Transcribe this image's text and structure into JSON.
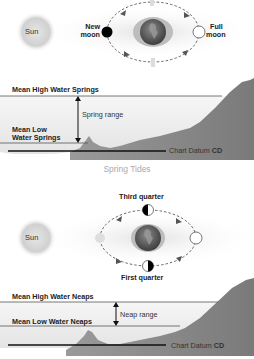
{
  "spring": {
    "sun_label": "Sun",
    "new_moon_label_1": "New",
    "new_moon_label_2": "moon",
    "full_moon_label_1": "Full",
    "full_moon_label_2": "moon",
    "mhws_label": "Mean High Water Springs",
    "mlws_label_1": "Mean Low",
    "mlws_label_2": "Water Springs",
    "range_label": "Spring range",
    "datum_label": "Chart Datum",
    "datum_abbrev": "CD",
    "caption": "Spring Tides"
  },
  "neap": {
    "sun_label": "Sun",
    "third_quarter_label": "Third quarter",
    "first_quarter_label": "First quarter",
    "mhwn_label": "Mean High Water Neaps",
    "mlwn_label": "Mean Low Water Neaps",
    "range_label": "Neap range",
    "datum_label": "Chart Datum",
    "datum_abbrev": "CD"
  },
  "colors": {
    "land": "#8c8c8c",
    "water": "#efefef",
    "line": "#1a1a1a",
    "orbit": "#666666"
  }
}
